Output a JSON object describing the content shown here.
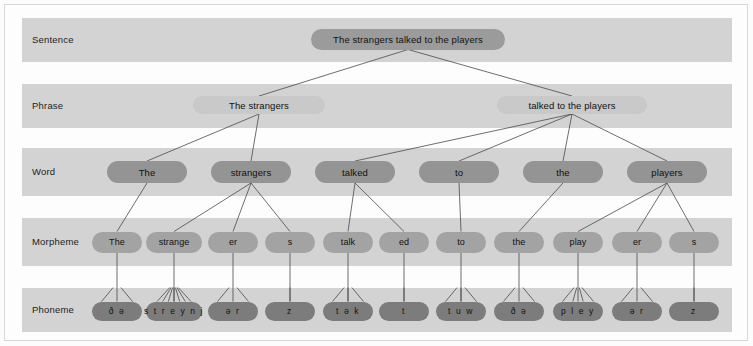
{
  "figure": {
    "background_color": "#fcfcfc",
    "band_color": "#d3d3d3",
    "line_color": "#4a4a4a"
  },
  "levels": [
    {
      "key": "sentence",
      "label": "Sentence",
      "band_y": 18,
      "band_height": 44,
      "pill_color": "#9b9b9b"
    },
    {
      "key": "phrase",
      "label": "Phrase",
      "band_y": 84,
      "band_height": 44,
      "pill_color": "#c9c9c9"
    },
    {
      "key": "word",
      "label": "Word",
      "band_y": 148,
      "band_height": 48,
      "pill_color": "#949494"
    },
    {
      "key": "morpheme",
      "label": "Morpheme",
      "band_y": 218,
      "band_height": 48,
      "pill_color": "#a3a3a3"
    },
    {
      "key": "phoneme",
      "label": "Phoneme",
      "band_y": 288,
      "band_height": 44,
      "pill_color": "#7c7c7c"
    }
  ],
  "nodes": {
    "sentence": [
      {
        "id": "s0",
        "text": "The strangers talked to the players",
        "cx": 408,
        "cy": 39,
        "w": 194
      }
    ],
    "phrase": [
      {
        "id": "p0",
        "text": "The strangers",
        "cx": 259,
        "cy": 105,
        "w": 132
      },
      {
        "id": "p1",
        "text": "talked to the players",
        "cx": 572,
        "cy": 105,
        "w": 150
      }
    ],
    "word": [
      {
        "id": "w0",
        "text": "The",
        "cx": 147,
        "cy": 172,
        "w": 80
      },
      {
        "id": "w1",
        "text": "strangers",
        "cx": 251,
        "cy": 172,
        "w": 80
      },
      {
        "id": "w2",
        "text": "talked",
        "cx": 355,
        "cy": 172,
        "w": 80
      },
      {
        "id": "w3",
        "text": "to",
        "cx": 459,
        "cy": 172,
        "w": 80
      },
      {
        "id": "w4",
        "text": "the",
        "cx": 563,
        "cy": 172,
        "w": 80
      },
      {
        "id": "w5",
        "text": "players",
        "cx": 667,
        "cy": 172,
        "w": 80
      }
    ],
    "morpheme": [
      {
        "id": "m0",
        "text": "The",
        "cx": 117,
        "cy": 242,
        "w": 50
      },
      {
        "id": "m1",
        "text": "strange",
        "cx": 174,
        "cy": 242,
        "w": 56
      },
      {
        "id": "m2",
        "text": "er",
        "cx": 233,
        "cy": 242,
        "w": 50
      },
      {
        "id": "m3",
        "text": "s",
        "cx": 290,
        "cy": 242,
        "w": 50
      },
      {
        "id": "m4",
        "text": "talk",
        "cx": 348,
        "cy": 242,
        "w": 50
      },
      {
        "id": "m5",
        "text": "ed",
        "cx": 404,
        "cy": 242,
        "w": 50
      },
      {
        "id": "m6",
        "text": "to",
        "cx": 461,
        "cy": 242,
        "w": 50
      },
      {
        "id": "m7",
        "text": "the",
        "cx": 519,
        "cy": 242,
        "w": 50
      },
      {
        "id": "m8",
        "text": "play",
        "cx": 578,
        "cy": 242,
        "w": 50
      },
      {
        "id": "m9",
        "text": "er",
        "cx": 637,
        "cy": 242,
        "w": 50
      },
      {
        "id": "m10",
        "text": "s",
        "cx": 694,
        "cy": 242,
        "w": 50
      }
    ],
    "phoneme": [
      {
        "id": "f0",
        "text": "ð ə",
        "cx": 117,
        "cy": 311,
        "w": 50
      },
      {
        "id": "f1",
        "text": "s t r e y n j",
        "cx": 174,
        "cy": 311,
        "w": 56
      },
      {
        "id": "f2",
        "text": "ə r",
        "cx": 233,
        "cy": 311,
        "w": 50
      },
      {
        "id": "f3",
        "text": "z",
        "cx": 290,
        "cy": 311,
        "w": 50
      },
      {
        "id": "f4",
        "text": "t ə k",
        "cx": 348,
        "cy": 311,
        "w": 50
      },
      {
        "id": "f5",
        "text": "t",
        "cx": 404,
        "cy": 311,
        "w": 50
      },
      {
        "id": "f6",
        "text": "t u w",
        "cx": 461,
        "cy": 311,
        "w": 50
      },
      {
        "id": "f7",
        "text": "ð ə",
        "cx": 519,
        "cy": 311,
        "w": 50
      },
      {
        "id": "f8",
        "text": "p l e y",
        "cx": 578,
        "cy": 311,
        "w": 50
      },
      {
        "id": "f9",
        "text": "ə r",
        "cx": 637,
        "cy": 311,
        "w": 50
      },
      {
        "id": "f10",
        "text": "z",
        "cx": 694,
        "cy": 311,
        "w": 50
      }
    ]
  },
  "edges": [
    {
      "from": "s0",
      "to": "p0"
    },
    {
      "from": "s0",
      "to": "p1"
    },
    {
      "from": "p0",
      "to": "w0"
    },
    {
      "from": "p0",
      "to": "w1"
    },
    {
      "from": "p1",
      "to": "w2"
    },
    {
      "from": "p1",
      "to": "w3"
    },
    {
      "from": "p1",
      "to": "w4"
    },
    {
      "from": "p1",
      "to": "w5"
    },
    {
      "from": "w0",
      "to": "m0"
    },
    {
      "from": "w1",
      "to": "m1"
    },
    {
      "from": "w1",
      "to": "m2"
    },
    {
      "from": "w1",
      "to": "m3"
    },
    {
      "from": "w2",
      "to": "m4"
    },
    {
      "from": "w2",
      "to": "m5"
    },
    {
      "from": "w3",
      "to": "m6"
    },
    {
      "from": "w4",
      "to": "m7"
    },
    {
      "from": "w5",
      "to": "m8"
    },
    {
      "from": "w5",
      "to": "m9"
    },
    {
      "from": "w5",
      "to": "m10"
    },
    {
      "from": "m0",
      "to": "f0"
    },
    {
      "from": "m1",
      "to": "f1"
    },
    {
      "from": "m2",
      "to": "f2"
    },
    {
      "from": "m3",
      "to": "f3"
    },
    {
      "from": "m4",
      "to": "f4"
    },
    {
      "from": "m5",
      "to": "f5"
    },
    {
      "from": "m6",
      "to": "f6"
    },
    {
      "from": "m7",
      "to": "f7"
    },
    {
      "from": "m8",
      "to": "f8"
    },
    {
      "from": "m9",
      "to": "f9"
    },
    {
      "from": "m10",
      "to": "f10"
    }
  ],
  "phoneme_fanouts": [
    {
      "node": "f0",
      "count": 2
    },
    {
      "node": "f1",
      "count": 7
    },
    {
      "node": "f2",
      "count": 2
    },
    {
      "node": "f3",
      "count": 1
    },
    {
      "node": "f4",
      "count": 3
    },
    {
      "node": "f5",
      "count": 1
    },
    {
      "node": "f6",
      "count": 3
    },
    {
      "node": "f7",
      "count": 2
    },
    {
      "node": "f8",
      "count": 4
    },
    {
      "node": "f9",
      "count": 2
    },
    {
      "node": "f10",
      "count": 1
    }
  ]
}
